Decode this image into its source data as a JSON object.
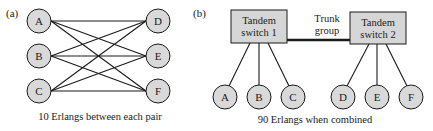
{
  "panel_a": {
    "label": "(a)",
    "left_nodes": [
      "A",
      "B",
      "C"
    ],
    "right_nodes": [
      "D",
      "E",
      "F"
    ],
    "caption": "10 Erlangs between each pair"
  },
  "panel_b": {
    "label": "(b)",
    "switch1": {
      "line1": "Tandem",
      "line2": "switch 1"
    },
    "switch2": {
      "line1": "Tandem",
      "line2": "switch 2"
    },
    "trunk": {
      "line1": "Trunk",
      "line2": "group"
    },
    "nodes": [
      "A",
      "B",
      "C",
      "D",
      "E",
      "F"
    ],
    "caption": "90 Erlangs when combined"
  },
  "colors": {
    "node_fill": "#d9d9d9",
    "box_fill": "#d6d6d6",
    "stroke": "#1a1a1a"
  }
}
